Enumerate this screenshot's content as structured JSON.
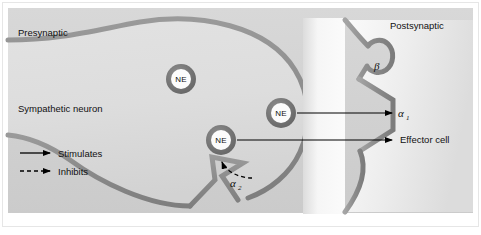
{
  "figure": {
    "background_color": "#ffffff",
    "panel_color": "#d4d4d4",
    "panel_border_color": "#e8e8e8",
    "membrane_color": "#8c8c8c",
    "cytoplasm_color": "#d9d9d9",
    "cleft_color": "#f2f2f2",
    "vesicle_ring_color": "#6e6e6e",
    "vesicle_fill_color": "#ffffff",
    "arrow_color": "#000000",
    "text_color": "#111111"
  },
  "labels": {
    "presynaptic": "Presynaptic",
    "postsynaptic": "Postsynaptic",
    "sympathetic_neuron": "Sympathetic neuron",
    "effector_cell": "Effector cell"
  },
  "vesicles": [
    {
      "label": "NE",
      "cx": 181,
      "cy": 79,
      "r": 15
    },
    {
      "label": "NE",
      "cx": 281,
      "cy": 113,
      "r": 15
    },
    {
      "label": "NE",
      "cx": 221,
      "cy": 140,
      "r": 15
    }
  ],
  "receptors": [
    {
      "id": "beta",
      "label": "β",
      "sub": "",
      "x": 378,
      "y": 66
    },
    {
      "id": "alpha1",
      "label": "α",
      "sub": "1",
      "x": 399,
      "y": 117
    },
    {
      "id": "alpha2",
      "label": "α",
      "sub": "2",
      "x": 233,
      "y": 186
    }
  ],
  "legend": {
    "items": [
      {
        "id": "stimulates",
        "label": "Stimulates",
        "line_style": "solid"
      },
      {
        "id": "inhibits",
        "label": "Inhibits",
        "line_style": "dashed"
      }
    ]
  },
  "arrows": [
    {
      "id": "ne-to-alpha1",
      "style": "solid",
      "from": [
        298,
        113
      ],
      "to": [
        394,
        113
      ]
    },
    {
      "id": "ne-to-effector",
      "style": "solid",
      "from": [
        238,
        140
      ],
      "to": [
        394,
        140
      ]
    },
    {
      "id": "ne-to-alpha2",
      "style": "dashed",
      "from": [
        252,
        177
      ],
      "to": [
        222,
        160
      ]
    }
  ]
}
